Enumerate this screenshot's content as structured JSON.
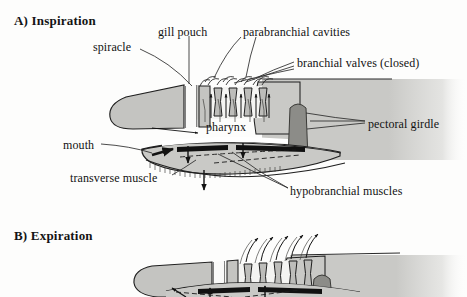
{
  "figure": {
    "kind": "anatomical-diagram",
    "background_color": "#fdfdfc",
    "ink_color": "#121212"
  },
  "palette": {
    "body_fill": "#c9c9c6",
    "head_fill": "#c4c4c1",
    "cavity_fill": "#f4f4f2",
    "lamella_fill": "#bdbdba",
    "girdle_fill": "#8c8c88",
    "muscle_bar": "#111111",
    "outline": "#1a1a1a"
  },
  "panels": [
    {
      "id": "A",
      "title": "A) Inspiration",
      "flow_direction": "inward",
      "valve_state": "closed",
      "labels": [
        {
          "id": "spiracle",
          "text": "spiracle"
        },
        {
          "id": "gill-pouch",
          "text": "gill pouch"
        },
        {
          "id": "parabranchial",
          "text": "parabranchial cavities"
        },
        {
          "id": "branchial",
          "text": "branchial valves (closed)"
        },
        {
          "id": "pectoral",
          "text": "pectoral girdle"
        },
        {
          "id": "pharynx",
          "text": "pharynx"
        },
        {
          "id": "mouth",
          "text": "mouth"
        },
        {
          "id": "transverse",
          "text": "transverse muscle"
        },
        {
          "id": "hypobranchial",
          "text": "hypobranchial muscles"
        }
      ],
      "gill_slit_count": 5,
      "arrow_notes": "water drawn in through mouth and spiracle; pharynx expands; floor of mouth drops"
    },
    {
      "id": "B",
      "title": "B) Expiration",
      "flow_direction": "outward",
      "valve_state": "open",
      "labels": [],
      "gill_slit_count": 5,
      "arrow_notes": "water expelled through open branchial valves; floor of mouth rises"
    }
  ]
}
